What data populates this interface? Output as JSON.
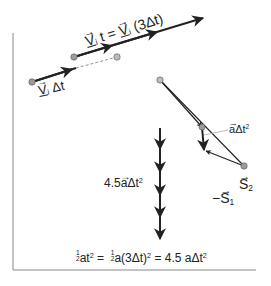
{
  "figure": {
    "labels": {
      "top_equation": "V⃗ᵢt = V⃗ᵢ(3Δt)",
      "top_equation_parts": {
        "v1": "V",
        "sub1": "i",
        "t": "t =",
        "v2": "V",
        "sub2": "i",
        "rest": "(3Δt)"
      },
      "small_vector": {
        "v": "V",
        "sub": "i",
        "rest": "Δt"
      },
      "a_dt2": {
        "a": "a",
        "rest": "Δt",
        "exp": "2"
      },
      "s2": {
        "s": "S",
        "sub": "2"
      },
      "neg_s1": {
        "minus": "−",
        "s": "S",
        "sub": "1"
      },
      "stack_label": {
        "coef": "4.5",
        "a": "a",
        "rest": "Δt",
        "exp": "2"
      },
      "bottom_equation": {
        "half1_num": "1",
        "half1_den": "2",
        "part1": "at",
        "exp1": "2",
        "eq1": "=",
        "half2_num": "1",
        "half2_den": "2",
        "part2": "a(3Δt)",
        "exp2": "2",
        "eq2": "= 4.5",
        "part3": "aΔt",
        "exp3": "2"
      }
    },
    "colors": {
      "ink": "#222222",
      "point_fill": "#9a9a9a",
      "frame": "#888888",
      "leader": "#aaaaaa"
    }
  }
}
